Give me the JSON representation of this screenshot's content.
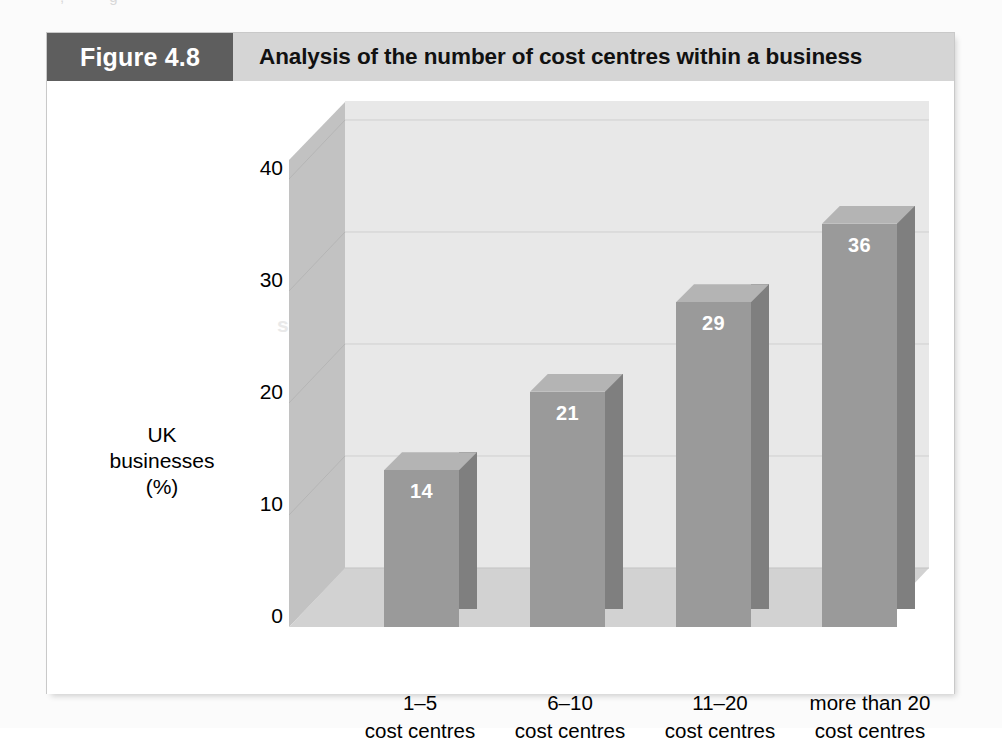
{
  "figure": {
    "number_label": "Figure 4.8",
    "title": "Analysis of the number of cost centres within a business"
  },
  "ghost_text": {
    "line1": "a new business, which",
    "line2": "that it may need",
    "line3": "setting up a business"
  },
  "chart_data": {
    "type": "bar",
    "title": "Analysis of the number of cost centres within a business",
    "xlabel": "",
    "ylabel": "UK businesses (%)",
    "ylabel_lines": [
      "UK",
      "businesses",
      "(%)"
    ],
    "categories": [
      "1–5 cost centres",
      "6–10 cost centres",
      "11–20 cost centres",
      "more than 20 cost centres"
    ],
    "category_lines": [
      {
        "l1": "1–5",
        "l2": "cost centres"
      },
      {
        "l1": "6–10",
        "l2": "cost centres"
      },
      {
        "l1": "11–20",
        "l2": "cost centres"
      },
      {
        "l1": "more than 20",
        "l2": "cost centres"
      }
    ],
    "values": [
      14,
      21,
      29,
      36
    ],
    "value_labels": [
      "14",
      "21",
      "29",
      "36"
    ],
    "ylim": [
      0,
      40
    ],
    "yticks": [
      0,
      10,
      20,
      30,
      40
    ],
    "ytick_labels": [
      "0",
      "10",
      "20",
      "30",
      "40"
    ],
    "grid": true,
    "legend": null,
    "three_d": true
  },
  "colors": {
    "figure_number_bg": "#5e5e5e",
    "header_bg": "#d5d5d5",
    "bar_front": "#9a9a9a",
    "bar_side": "#7f7f7f",
    "bar_top": "#b4b4b4",
    "back_wall": "#e8e8e8",
    "left_wall": "#c2c2c2",
    "floor": "#d2d2d2",
    "gridline": "#cfcfcf",
    "value_label": "#ffffff",
    "text": "#000000"
  }
}
